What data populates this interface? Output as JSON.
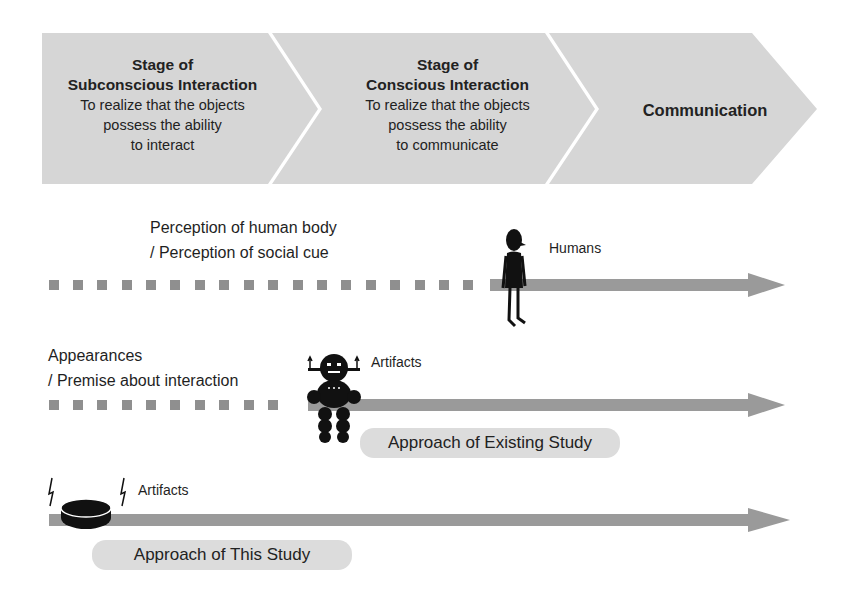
{
  "stages": [
    {
      "title_line1": "Stage of",
      "title_line2": "Subconscious Interaction",
      "desc_line1": "To realize that the objects",
      "desc_line2": "possess the ability",
      "desc_line3": "to interact"
    },
    {
      "title_line1": "Stage of",
      "title_line2": "Conscious Interaction",
      "desc_line1": "To realize that the objects",
      "desc_line2": "possess the ability",
      "desc_line3": "to communicate"
    },
    {
      "title": "Communication"
    }
  ],
  "rows": [
    {
      "label_line1": "Perception of human body",
      "label_line2": "/ Perception of social cue",
      "agent_label": "Humans",
      "agent_icon": "human-figure-icon"
    },
    {
      "label_line1": "Appearances",
      "label_line2": "/ Premise about interaction",
      "agent_label": "Artifacts",
      "agent_icon": "robot-icon",
      "approach": "Approach of Existing Study"
    },
    {
      "agent_label": "Artifacts",
      "agent_icon": "disc-device-icon",
      "approach": "Approach of This Study"
    }
  ],
  "colors": {
    "chevron": "#d6d6d6",
    "arrow": "#9a9a9a",
    "dash": "#8f8f8f",
    "pill": "#dcdcdc",
    "icon": "#111111"
  }
}
